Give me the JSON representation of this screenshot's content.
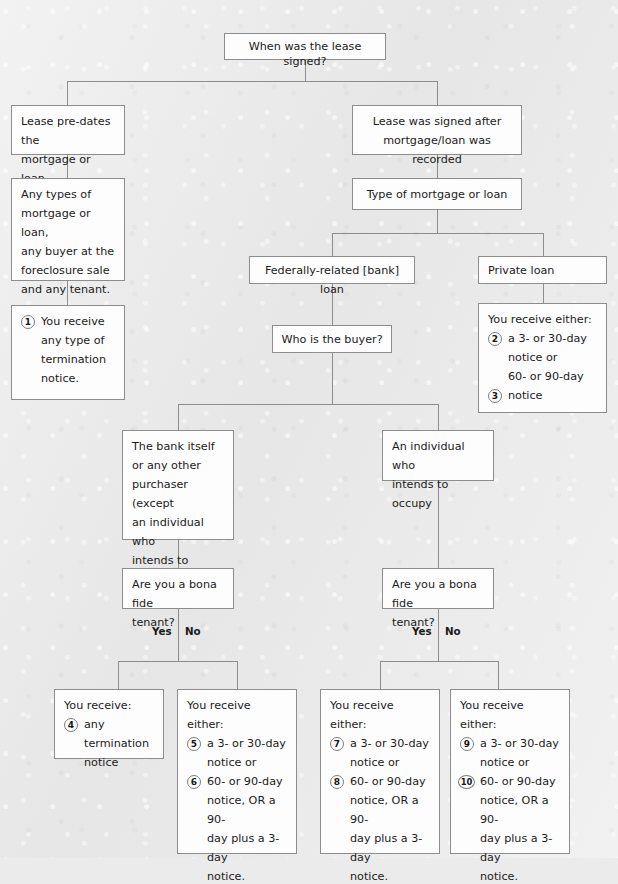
{
  "page": {
    "header_artifact": "·                              ·",
    "background_color": "#ebebeb",
    "box_fill": "#fdfdfd",
    "box_border": "#8d8d8d",
    "line_color": "#8d8d8d",
    "text_color": "#1b1b1b"
  },
  "nodes": {
    "root": {
      "text": "When was the lease signed?"
    },
    "pre_dates": {
      "line1": "Lease pre-dates the",
      "line2": "mortgage or loan"
    },
    "after_recorded": {
      "line1": "Lease was signed after",
      "line2": "mortgage/loan was recorded"
    },
    "any_types": {
      "line1": "Any types of",
      "line2": "mortgage or loan,",
      "line3": "any buyer at the",
      "line4": "foreclosure sale",
      "line5": "and any tenant."
    },
    "type_of_mortgage": {
      "text": "Type of mortgage or loan"
    },
    "federally_related": {
      "text": "Federally-related [bank] loan"
    },
    "private_loan": {
      "text": "Private loan"
    },
    "who_is_buyer": {
      "text": "Who is the buyer?"
    },
    "bank_itself": {
      "line1": "The bank itself",
      "line2": "or any other",
      "line3": "purchaser (except",
      "line4": "an individual who",
      "line5": "intends to occupy.)"
    },
    "individual_occupy": {
      "line1": "An individual who",
      "line2": "intends to occupy"
    },
    "bona_fide_left": {
      "line1": "Are you a bona fide",
      "line2": "tenant?"
    },
    "bona_fide_right": {
      "line1": "Are you a bona fide",
      "line2": "tenant?"
    }
  },
  "branch_labels": {
    "left_yes": "Yes",
    "left_no": "No",
    "right_yes": "Yes",
    "right_no": "No"
  },
  "outcomes": {
    "o1": {
      "lead": "",
      "items": [
        {
          "num": "1",
          "line1": "You receive",
          "line2": "any type of",
          "line3": "termination",
          "line4": "notice."
        }
      ]
    },
    "o23": {
      "lead": "You receive either:",
      "items": [
        {
          "num": "2",
          "line1": "a 3- or 30-day",
          "line2": "notice or"
        },
        {
          "num": "3",
          "pre1": "60- or 90-day",
          "line1": "notice"
        }
      ]
    },
    "o4": {
      "lead": "You receive:",
      "items": [
        {
          "num": "4",
          "line1": "any termination",
          "line2": "notice"
        }
      ]
    },
    "o56": {
      "lead": "You receive either:",
      "items": [
        {
          "num": "5",
          "line1": "a 3- or 30-day",
          "line2": "notice or"
        },
        {
          "num": "6",
          "line1": "60- or 90-day",
          "line2": "notice, OR a 90-",
          "line3": "day plus a 3-day",
          "line4": "notice."
        }
      ]
    },
    "o78": {
      "lead": "You receive either:",
      "items": [
        {
          "num": "7",
          "line1": "a 3- or 30-day",
          "line2": "notice or"
        },
        {
          "num": "8",
          "line1": "60- or 90-day",
          "line2": "notice, OR a 90-",
          "line3": "day plus a 3-day",
          "line4": "notice."
        }
      ]
    },
    "o910": {
      "lead": "You receive either:",
      "items": [
        {
          "num": "9",
          "line1": "a 3- or 30-day",
          "line2": "notice or"
        },
        {
          "num": "10",
          "line1": "60- or 90-day",
          "line2": "notice, OR a 90-",
          "line3": "day plus a 3-day",
          "line4": "notice."
        }
      ]
    }
  }
}
